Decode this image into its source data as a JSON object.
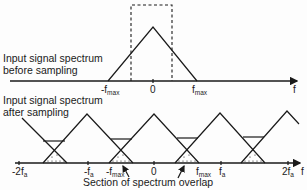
{
  "top_panel": {
    "caption_line1": "Input signal spectrum",
    "caption_line2": "before sampling",
    "labels": {
      "neg_fmax": "-f",
      "neg_fmax_sub": "max",
      "zero": "0",
      "fmax": "f",
      "fmax_sub": "max",
      "axis": "f"
    }
  },
  "bottom_panel": {
    "caption_line1": "Input signal spectrum",
    "caption_line2": "after sampling",
    "labels": {
      "neg_2fs": "-2f",
      "neg_2fs_sub": "a",
      "neg_fs": "-f",
      "neg_fs_sub": "a",
      "neg_fmax": "-f",
      "neg_fmax_sub": "max",
      "zero": "0",
      "fmax": "f",
      "fmax_sub": "max",
      "fs": "f",
      "fs_sub": "a",
      "two_fs": "2f",
      "two_fs_sub": "a",
      "axis": "f"
    },
    "overlap_caption": "Section of spectrum overlap"
  }
}
